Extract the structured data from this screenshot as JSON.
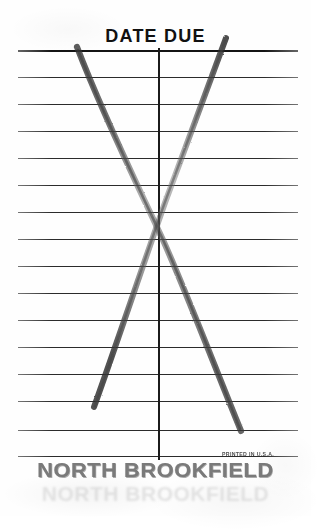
{
  "card": {
    "title": "DATE DUE",
    "brand": "NORTH BROOKFIELD",
    "printed_note": "PRINTED IN U.S.A.",
    "colors": {
      "paper": "#fefefe",
      "rule_line": "#2b2b2b",
      "ink_text": "#111111",
      "brand_text": "#6f6f6f",
      "pencil": "#555555"
    },
    "ruled_lines_y": [
      50,
      77,
      104,
      131,
      158,
      185,
      212,
      239,
      266,
      293,
      320,
      347,
      374,
      401,
      430,
      456
    ],
    "vertical_divider_x": 158,
    "pencil_marks": [
      {
        "name": "stroke-left-to-right-down",
        "from": [
          77,
          48
        ],
        "to": [
          240,
          430
        ]
      },
      {
        "name": "stroke-right-to-left-down",
        "from": [
          224,
          38
        ],
        "to": [
          93,
          408
        ]
      }
    ]
  }
}
